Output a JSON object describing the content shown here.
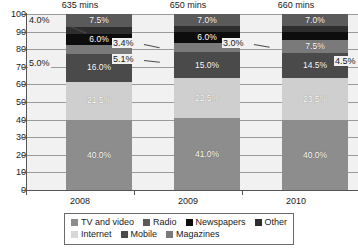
{
  "chart_data": {
    "type": "bar",
    "subtype": "stacked-percentage-column",
    "title": "",
    "xlabel": "",
    "ylabel": "",
    "categories": [
      "2008",
      "2009",
      "2010"
    ],
    "ylim": [
      0,
      100
    ],
    "yticks": [
      0,
      10,
      20,
      30,
      40,
      50,
      60,
      70,
      80,
      90,
      100
    ],
    "ytick_labels": [
      "0",
      "10",
      "20",
      "30",
      "40",
      "50",
      "60",
      "70",
      "80",
      "90",
      "100"
    ],
    "grid": true,
    "legend_position": "bottom",
    "category_annotations": [
      "635 mins",
      "650 mins",
      "660 mins"
    ],
    "series": [
      {
        "name": "TV and video",
        "color": "#8d8d8d",
        "values": [
          40.0,
          41.0,
          40.0
        ],
        "labels": [
          "40.0%",
          "41.0%",
          "40.0%"
        ],
        "label_mode": "inside"
      },
      {
        "name": "Internet",
        "color": "#cfcfcf",
        "values": [
          21.5,
          22.5,
          23.5
        ],
        "labels": [
          "21.5%",
          "22.5%",
          "23.5%"
        ],
        "label_mode": "inside"
      },
      {
        "name": "Mobile",
        "color": "#4a4a4a",
        "values": [
          16.0,
          15.0,
          14.5
        ],
        "labels": [
          "16.0%",
          "15.0%",
          "14.5%"
        ],
        "label_mode": "inside"
      },
      {
        "name": "Magazines",
        "color": "#7a7a7a",
        "values": [
          5.0,
          5.1,
          7.5
        ],
        "labels": [
          "5.0%",
          "5.1%",
          "7.5%"
        ],
        "label_mode": "mixed"
      },
      {
        "name": "Newspapers",
        "color": "#0d0d0d",
        "values": [
          6.0,
          6.0,
          4.5
        ],
        "labels": [
          "6.0%",
          "6.0%",
          "4.5%"
        ],
        "label_mode": "mixed"
      },
      {
        "name": "Other",
        "color": "#2e2e2e",
        "values": [
          4.0,
          3.4,
          3.0
        ],
        "labels": [
          "4.0%",
          "3.4%",
          "3.0%"
        ],
        "label_mode": "callout"
      },
      {
        "name": "Radio",
        "color": "#5a5a5a",
        "values": [
          7.5,
          7.0,
          7.0
        ],
        "labels": [
          "7.5%",
          "7.0%",
          "7.0%"
        ],
        "label_mode": "inside"
      }
    ],
    "callouts": [
      {
        "text": "4.0%",
        "series": "Other",
        "category": "2008",
        "side": "left"
      },
      {
        "text": "5.0%",
        "series": "Magazines",
        "category": "2008",
        "side": "left"
      },
      {
        "text": "3.4%",
        "series": "Other",
        "category": "2009",
        "side": "left"
      },
      {
        "text": "5.1%",
        "series": "Newspapers",
        "category": "2009",
        "side": "left"
      },
      {
        "text": "3.0%",
        "series": "Other",
        "category": "2010",
        "side": "left"
      },
      {
        "text": "4.5%",
        "series": "Newspapers",
        "category": "2010",
        "side": "right"
      }
    ]
  },
  "axis": {
    "y_labels": [
      "100",
      "90",
      "80",
      "70",
      "60",
      "50",
      "40",
      "30",
      "20",
      "10",
      "0"
    ],
    "x_labels": [
      "2008",
      "2009",
      "2010"
    ]
  },
  "annotations": {
    "top": [
      "635 mins",
      "650 mins",
      "660 mins"
    ]
  },
  "legend": {
    "row1": [
      {
        "label": "TV and video",
        "color": "#8d8d8d"
      },
      {
        "label": "Radio",
        "color": "#5a5a5a"
      },
      {
        "label": "Newspapers",
        "color": "#0d0d0d"
      },
      {
        "label": "Other",
        "color": "#2e2e2e"
      }
    ],
    "row2": [
      {
        "label": "Internet",
        "color": "#d8d8d8"
      },
      {
        "label": "Mobile",
        "color": "#4a4a4a"
      },
      {
        "label": "Magazines",
        "color": "#7a7a7a"
      }
    ]
  },
  "bar_labels": {
    "b2008": [
      "40.0%",
      "21.5%",
      "16.0%",
      "",
      "6.0%",
      "",
      "7.5%"
    ],
    "b2009": [
      "41.0%",
      "22.5%",
      "15.0%",
      "",
      "6.0%",
      "",
      "7.0%"
    ],
    "b2010": [
      "40.0%",
      "23.5%",
      "14.5%",
      "7.5%",
      "",
      "",
      "7.0%"
    ]
  }
}
